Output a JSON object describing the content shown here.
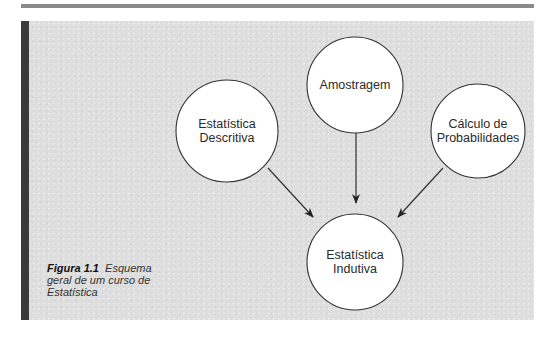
{
  "diagram": {
    "nodes": [
      {
        "id": "amostragem",
        "lines": [
          "Amostragem"
        ],
        "cx": 355,
        "cy": 85,
        "r": 48
      },
      {
        "id": "descritiva",
        "lines": [
          "Estatística",
          "Descritiva"
        ],
        "cx": 227,
        "cy": 131,
        "r": 51
      },
      {
        "id": "probabilidades",
        "lines": [
          "Cálculo de",
          "Probabilidades"
        ],
        "cx": 478,
        "cy": 131,
        "r": 47
      },
      {
        "id": "indutiva",
        "lines": [
          "Estatística",
          "Indutiva"
        ],
        "cx": 355,
        "cy": 262,
        "r": 48
      }
    ],
    "edges": [
      {
        "from": "descritiva",
        "to": "indutiva"
      },
      {
        "from": "amostragem",
        "to": "indutiva"
      },
      {
        "from": "probabilidades",
        "to": "indutiva"
      }
    ]
  },
  "caption": {
    "figure_label": "Figura 1.1",
    "text": "Esquema geral de um curso de Estatística"
  },
  "colors": {
    "panel_bg": "#dedede",
    "panel_bar": "#3a3a3a",
    "top_rule": "#8a8a8a",
    "node_fill": "#ffffff",
    "stroke": "#333333"
  }
}
